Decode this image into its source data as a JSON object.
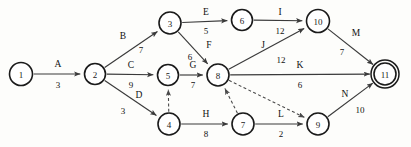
{
  "diagram": {
    "type": "activity-on-arrow-network",
    "background_color": "#fdfdfb",
    "line_color": "#3a3a3a",
    "text_color": "#111111",
    "nodes": [
      {
        "id": "1",
        "label": "1",
        "x": 21,
        "y": 74,
        "r": 11.5,
        "double": false
      },
      {
        "id": "2",
        "label": "2",
        "x": 95,
        "y": 74,
        "r": 10.5,
        "double": false
      },
      {
        "id": "3",
        "label": "3",
        "x": 170,
        "y": 23,
        "r": 11.0,
        "double": false
      },
      {
        "id": "4",
        "label": "4",
        "x": 169,
        "y": 124,
        "r": 11.0,
        "double": false
      },
      {
        "id": "5",
        "label": "5",
        "x": 168,
        "y": 75,
        "r": 10.5,
        "double": false
      },
      {
        "id": "6",
        "label": "6",
        "x": 242,
        "y": 20,
        "r": 10.5,
        "double": false
      },
      {
        "id": "7",
        "label": "7",
        "x": 243,
        "y": 124,
        "r": 11.0,
        "double": false
      },
      {
        "id": "8",
        "label": "8",
        "x": 218,
        "y": 75,
        "r": 11.0,
        "double": false
      },
      {
        "id": "9",
        "label": "9",
        "x": 318,
        "y": 124,
        "r": 11.0,
        "double": false
      },
      {
        "id": "10",
        "label": "10",
        "x": 318,
        "y": 21,
        "r": 11.5,
        "double": false
      },
      {
        "id": "11",
        "label": "11",
        "x": 385,
        "y": 74,
        "r": 11.0,
        "double": true
      }
    ],
    "edges": [
      {
        "id": "A",
        "from": "1",
        "to": "2",
        "name": "A",
        "duration": "3",
        "dashed": false,
        "name_x": 58,
        "name_y": 64,
        "dur_x": 58,
        "dur_y": 85
      },
      {
        "id": "B",
        "from": "2",
        "to": "3",
        "name": "B",
        "duration": "7",
        "dashed": false,
        "name_x": 123,
        "name_y": 36,
        "dur_x": 141,
        "dur_y": 50
      },
      {
        "id": "C",
        "from": "2",
        "to": "5",
        "name": "C",
        "duration": "9",
        "dashed": false,
        "name_x": 131,
        "name_y": 65,
        "dur_x": 131,
        "dur_y": 85
      },
      {
        "id": "D",
        "from": "2",
        "to": "4",
        "name": "D",
        "duration": "3",
        "dashed": false,
        "name_x": 139,
        "name_y": 95,
        "dur_x": 123,
        "dur_y": 111
      },
      {
        "id": "E",
        "from": "3",
        "to": "6",
        "name": "E",
        "duration": "5",
        "dashed": false,
        "name_x": 206,
        "name_y": 12,
        "dur_x": 206,
        "dur_y": 31
      },
      {
        "id": "F",
        "from": "3",
        "to": "8",
        "name": "F",
        "duration": "6",
        "dashed": false,
        "name_x": 209,
        "name_y": 45,
        "dur_x": 190,
        "dur_y": 57
      },
      {
        "id": "G",
        "from": "5",
        "to": "8",
        "name": "G",
        "duration": "7",
        "dashed": false,
        "name_x": 193,
        "name_y": 65,
        "dur_x": 193,
        "dur_y": 85
      },
      {
        "id": "H",
        "from": "4",
        "to": "7",
        "name": "H",
        "duration": "8",
        "dashed": false,
        "name_x": 206,
        "name_y": 114,
        "dur_x": 206,
        "dur_y": 134
      },
      {
        "id": "I",
        "from": "6",
        "to": "10",
        "name": "I",
        "duration": "12",
        "dashed": false,
        "name_x": 280,
        "name_y": 12,
        "dur_x": 280,
        "dur_y": 31
      },
      {
        "id": "J",
        "from": "8",
        "to": "10",
        "name": "J",
        "duration": "12",
        "dashed": false,
        "name_x": 263,
        "name_y": 45,
        "dur_x": 281,
        "dur_y": 60
      },
      {
        "id": "K",
        "from": "8",
        "to": "11",
        "name": "K",
        "duration": "6",
        "dashed": false,
        "name_x": 300,
        "name_y": 65,
        "dur_x": 300,
        "dur_y": 85
      },
      {
        "id": "L",
        "from": "7",
        "to": "9",
        "name": "L",
        "duration": "2",
        "dashed": false,
        "name_x": 281,
        "name_y": 114,
        "dur_x": 281,
        "dur_y": 134
      },
      {
        "id": "M",
        "from": "10",
        "to": "11",
        "name": "M",
        "duration": "7",
        "dashed": false,
        "name_x": 356,
        "name_y": 33,
        "dur_x": 342,
        "dur_y": 52
      },
      {
        "id": "N",
        "from": "9",
        "to": "11",
        "name": "N",
        "duration": "10",
        "dashed": false,
        "name_x": 345,
        "name_y": 94,
        "dur_x": 360,
        "dur_y": 110
      },
      {
        "id": "d1",
        "from": "4",
        "to": "5",
        "name": "",
        "duration": "",
        "dashed": true,
        "name_x": 0,
        "name_y": 0,
        "dur_x": 0,
        "dur_y": 0
      },
      {
        "id": "d2",
        "from": "7",
        "to": "8",
        "name": "",
        "duration": "",
        "dashed": true,
        "name_x": 0,
        "name_y": 0,
        "dur_x": 0,
        "dur_y": 0
      },
      {
        "id": "d3",
        "from": "8",
        "to": "9",
        "name": "",
        "duration": "",
        "dashed": true,
        "name_x": 0,
        "name_y": 0,
        "dur_x": 0,
        "dur_y": 0
      }
    ]
  }
}
